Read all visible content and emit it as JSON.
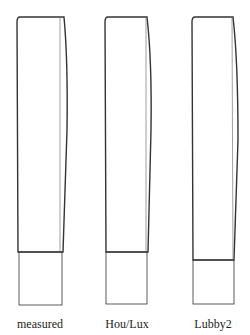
{
  "figure": {
    "stroke_color": "#333333",
    "panels": [
      {
        "label": "measured",
        "top_y": 17,
        "divider_y": 252,
        "bottom_y": 305,
        "left_x": 17,
        "right_top_x": 64,
        "right_bulge_x": 67,
        "right_divider_x": 63,
        "lower_left_x": 19,
        "lower_right_x": 62
      },
      {
        "label": "Hou/Lux",
        "top_y": 17,
        "divider_y": 252,
        "bottom_y": 304,
        "left_x": 105,
        "right_top_x": 147,
        "right_bulge_x": 151,
        "right_divider_x": 148,
        "lower_left_x": 106,
        "lower_right_x": 147
      },
      {
        "label": "Lubby2",
        "top_y": 17,
        "divider_y": 260,
        "bottom_y": 304,
        "left_x": 192,
        "right_top_x": 233,
        "right_bulge_x": 238,
        "right_divider_x": 234,
        "lower_left_x": 193,
        "lower_right_x": 234
      }
    ]
  }
}
